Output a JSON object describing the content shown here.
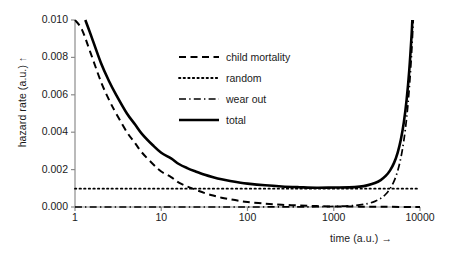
{
  "chart_data": {
    "type": "line",
    "title": "",
    "xlabel": "time (a.u.)  →",
    "ylabel": "hazard rate (a.u.)  ↑",
    "xscale": "log",
    "yscale": "linear",
    "xlim": [
      1,
      10000
    ],
    "ylim": [
      0.0,
      0.01
    ],
    "xticks": [
      1,
      10,
      100,
      1000,
      10000
    ],
    "xtick_labels": [
      "1",
      "10",
      "100",
      "1000",
      "10000"
    ],
    "yticks": [
      0.0,
      0.002,
      0.004,
      0.006,
      0.008,
      0.01
    ],
    "ytick_labels": [
      "0.000",
      "0.002",
      "0.004",
      "0.006",
      "0.008",
      "0.010"
    ],
    "grid": false,
    "legend_position": "upper center",
    "series": [
      {
        "name": "child mortality",
        "style": "dashed",
        "color": "#000000",
        "x": [
          1,
          1.2,
          1.5,
          2,
          2.5,
          3,
          4,
          5,
          6,
          8,
          10,
          13,
          16,
          20,
          25,
          32,
          40,
          50,
          63,
          80,
          100,
          160,
          250,
          400,
          630,
          1000,
          2000,
          4000,
          10000
        ],
        "y": [
          0.01,
          0.0095,
          0.0083,
          0.0067,
          0.0057,
          0.005,
          0.004,
          0.0034,
          0.0029,
          0.0023,
          0.0019,
          0.0016,
          0.0013,
          0.0011,
          0.00092,
          0.00074,
          0.00061,
          0.0005,
          0.00041,
          0.00033,
          0.00027,
          0.00018,
          0.00012,
          8e-05,
          5e-05,
          3e-05,
          2e-05,
          1e-05,
          0.0
        ]
      },
      {
        "name": "random",
        "style": "dotted",
        "color": "#000000",
        "x": [
          1,
          10000
        ],
        "y": [
          0.00098,
          0.00098
        ]
      },
      {
        "name": "wear out",
        "style": "dashdot",
        "color": "#000000",
        "x": [
          1,
          10,
          100,
          500,
          1000,
          1500,
          2000,
          2500,
          3000,
          3500,
          4000,
          4500,
          5000,
          5500,
          6000,
          6500,
          7000,
          7500,
          8000,
          8500,
          9000,
          9500,
          10000
        ],
        "y": [
          0.0,
          0.0,
          0.0,
          1e-05,
          3e-05,
          6e-05,
          0.00011,
          0.00019,
          0.0003,
          0.00046,
          0.00068,
          0.00098,
          0.00138,
          0.00192,
          0.00263,
          0.00356,
          0.00476,
          0.0063,
          0.00826,
          0.01074,
          0.01386,
          0.01776,
          0.0226
        ]
      },
      {
        "name": "total",
        "style": "solid",
        "color": "#000000",
        "x": [
          1,
          1.2,
          1.5,
          2,
          2.5,
          3,
          4,
          5,
          6,
          8,
          10,
          13,
          16,
          20,
          25,
          32,
          40,
          50,
          63,
          80,
          100,
          160,
          250,
          400,
          630,
          1000,
          1500,
          2000,
          2500,
          3000,
          3500,
          4000,
          4500,
          5000,
          5500,
          6000,
          6500,
          7000,
          7500,
          8000,
          8500,
          9000,
          9500,
          10000
        ],
        "y": [
          0.011,
          0.0105,
          0.0093,
          0.0077,
          0.0067,
          0.006,
          0.005,
          0.0044,
          0.0039,
          0.0033,
          0.0029,
          0.0026,
          0.0023,
          0.00208,
          0.0019,
          0.00172,
          0.00159,
          0.00148,
          0.00139,
          0.00131,
          0.00125,
          0.00116,
          0.0011,
          0.00106,
          0.00103,
          0.00104,
          0.00105,
          0.00109,
          0.00117,
          0.00128,
          0.00144,
          0.00166,
          0.00196,
          0.00236,
          0.0029,
          0.00361,
          0.00454,
          0.00574,
          0.00728,
          0.00924,
          0.01172,
          0.01484,
          0.01874,
          0.02358
        ]
      }
    ]
  },
  "legend": {
    "items": [
      {
        "label": "child mortality",
        "style": "dashed"
      },
      {
        "label": "random",
        "style": "dotted"
      },
      {
        "label": "wear out",
        "style": "dashdot"
      },
      {
        "label": "total",
        "style": "solid"
      }
    ]
  },
  "axes": {
    "ylabel": "hazard rate (a.u.)  ↑",
    "xlabel": "time (a.u.)  →",
    "ytick_labels": [
      "0.010",
      "0.008",
      "0.006",
      "0.004",
      "0.002",
      "0.000"
    ],
    "xtick_labels": [
      "1",
      "10",
      "100",
      "1000",
      "10000"
    ]
  },
  "colors": {
    "background": "#ffffff",
    "axis": "#808080",
    "curve": "#000000",
    "text": "#1a1a1a"
  }
}
